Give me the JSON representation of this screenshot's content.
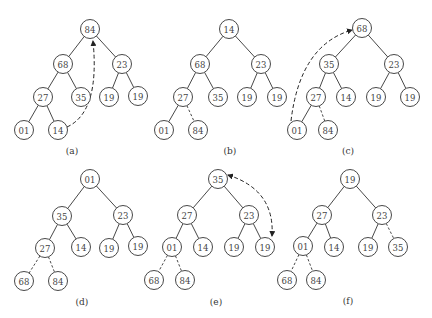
{
  "figure": {
    "node_radius": 9.5,
    "colors": {
      "stroke": "#333333",
      "text": "#444444",
      "background": "#ffffff"
    },
    "trees": [
      {
        "id": "a",
        "caption": "(a)",
        "caption_pos": [
          72,
          151
        ],
        "nodes": [
          {
            "value": "84",
            "x": 90,
            "y": 29
          },
          {
            "value": "68",
            "x": 63,
            "y": 64
          },
          {
            "value": "23",
            "x": 122,
            "y": 64
          },
          {
            "value": "27",
            "x": 43,
            "y": 97
          },
          {
            "value": "35",
            "x": 81,
            "y": 97
          },
          {
            "value": "19",
            "x": 109,
            "y": 97
          },
          {
            "value": "19",
            "x": 138,
            "y": 96
          },
          {
            "value": "01",
            "x": 24,
            "y": 130
          },
          {
            "value": "14",
            "x": 58,
            "y": 130
          }
        ],
        "edges": [
          [
            0,
            1,
            "solid"
          ],
          [
            0,
            2,
            "solid"
          ],
          [
            1,
            3,
            "solid"
          ],
          [
            1,
            4,
            "solid"
          ],
          [
            2,
            5,
            "solid"
          ],
          [
            2,
            6,
            "solid"
          ],
          [
            3,
            7,
            "solid"
          ],
          [
            3,
            8,
            "solid"
          ]
        ],
        "swap_arrow": {
          "from": 8,
          "to": 0,
          "path": "M67,127 Q100,112 93,41",
          "head": "end"
        }
      },
      {
        "id": "b",
        "caption": "(b)",
        "caption_pos": [
          230,
          151
        ],
        "nodes": [
          {
            "value": "14",
            "x": 229,
            "y": 29
          },
          {
            "value": "68",
            "x": 200,
            "y": 64
          },
          {
            "value": "23",
            "x": 261,
            "y": 64
          },
          {
            "value": "27",
            "x": 183,
            "y": 97
          },
          {
            "value": "35",
            "x": 218,
            "y": 97
          },
          {
            "value": "19",
            "x": 247,
            "y": 97
          },
          {
            "value": "19",
            "x": 277,
            "y": 97
          },
          {
            "value": "01",
            "x": 164,
            "y": 130
          },
          {
            "value": "84",
            "x": 198,
            "y": 130
          }
        ],
        "edges": [
          [
            0,
            1,
            "solid"
          ],
          [
            0,
            2,
            "solid"
          ],
          [
            1,
            3,
            "solid"
          ],
          [
            1,
            4,
            "solid"
          ],
          [
            2,
            5,
            "solid"
          ],
          [
            2,
            6,
            "solid"
          ],
          [
            3,
            7,
            "solid"
          ],
          [
            3,
            8,
            "dashed"
          ]
        ]
      },
      {
        "id": "c",
        "caption": "(c)",
        "caption_pos": [
          348,
          151
        ],
        "nodes": [
          {
            "value": "68",
            "x": 362,
            "y": 28
          },
          {
            "value": "35",
            "x": 329,
            "y": 64
          },
          {
            "value": "23",
            "x": 394,
            "y": 64
          },
          {
            "value": "27",
            "x": 316,
            "y": 97
          },
          {
            "value": "14",
            "x": 346,
            "y": 97
          },
          {
            "value": "19",
            "x": 376,
            "y": 97
          },
          {
            "value": "19",
            "x": 410,
            "y": 97
          },
          {
            "value": "01",
            "x": 297,
            "y": 130
          },
          {
            "value": "84",
            "x": 328,
            "y": 130
          }
        ],
        "edges": [
          [
            0,
            1,
            "solid"
          ],
          [
            0,
            2,
            "solid"
          ],
          [
            1,
            3,
            "solid"
          ],
          [
            1,
            4,
            "solid"
          ],
          [
            2,
            5,
            "solid"
          ],
          [
            2,
            6,
            "solid"
          ],
          [
            3,
            7,
            "solid"
          ],
          [
            3,
            8,
            "dashed"
          ]
        ],
        "swap_arrow": {
          "from": 7,
          "to": 0,
          "path": "M291,121 Q300,45 352,30",
          "head": "end"
        }
      },
      {
        "id": "d",
        "caption": "(d)",
        "caption_pos": [
          82,
          302
        ],
        "nodes": [
          {
            "value": "01",
            "x": 90,
            "y": 179
          },
          {
            "value": "35",
            "x": 62,
            "y": 216
          },
          {
            "value": "23",
            "x": 123,
            "y": 215
          },
          {
            "value": "27",
            "x": 45,
            "y": 248
          },
          {
            "value": "14",
            "x": 81,
            "y": 247
          },
          {
            "value": "19",
            "x": 109,
            "y": 248
          },
          {
            "value": "19",
            "x": 138,
            "y": 246
          },
          {
            "value": "68",
            "x": 24,
            "y": 281
          },
          {
            "value": "84",
            "x": 58,
            "y": 281
          }
        ],
        "edges": [
          [
            0,
            1,
            "solid"
          ],
          [
            0,
            2,
            "solid"
          ],
          [
            1,
            3,
            "solid"
          ],
          [
            1,
            4,
            "solid"
          ],
          [
            2,
            5,
            "solid"
          ],
          [
            2,
            6,
            "solid"
          ],
          [
            3,
            7,
            "dashed"
          ],
          [
            3,
            8,
            "dashed"
          ]
        ]
      },
      {
        "id": "e",
        "caption": "(e)",
        "caption_pos": [
          216,
          302
        ],
        "nodes": [
          {
            "value": "35",
            "x": 218,
            "y": 179
          },
          {
            "value": "27",
            "x": 187,
            "y": 215
          },
          {
            "value": "23",
            "x": 249,
            "y": 215
          },
          {
            "value": "01",
            "x": 172,
            "y": 247
          },
          {
            "value": "14",
            "x": 203,
            "y": 247
          },
          {
            "value": "19",
            "x": 234,
            "y": 247
          },
          {
            "value": "19",
            "x": 265,
            "y": 247
          },
          {
            "value": "68",
            "x": 154,
            "y": 280
          },
          {
            "value": "84",
            "x": 185,
            "y": 280
          }
        ],
        "edges": [
          [
            0,
            1,
            "solid"
          ],
          [
            0,
            2,
            "solid"
          ],
          [
            1,
            3,
            "solid"
          ],
          [
            1,
            4,
            "solid"
          ],
          [
            2,
            5,
            "solid"
          ],
          [
            2,
            6,
            "solid"
          ],
          [
            3,
            7,
            "dashed"
          ],
          [
            3,
            8,
            "dashed"
          ]
        ],
        "swap_arrow": {
          "from": 0,
          "to": 6,
          "path": "M228,175 Q275,190 272,236",
          "head": "both"
        }
      },
      {
        "id": "f",
        "caption": "(f)",
        "caption_pos": [
          348,
          301
        ],
        "nodes": [
          {
            "value": "19",
            "x": 350,
            "y": 179
          },
          {
            "value": "27",
            "x": 322,
            "y": 215
          },
          {
            "value": "23",
            "x": 382,
            "y": 215
          },
          {
            "value": "01",
            "x": 303,
            "y": 246
          },
          {
            "value": "14",
            "x": 334,
            "y": 247
          },
          {
            "value": "19",
            "x": 368,
            "y": 247
          },
          {
            "value": "35",
            "x": 398,
            "y": 247
          },
          {
            "value": "68",
            "x": 287,
            "y": 280
          },
          {
            "value": "84",
            "x": 316,
            "y": 280
          }
        ],
        "edges": [
          [
            0,
            1,
            "solid"
          ],
          [
            0,
            2,
            "solid"
          ],
          [
            1,
            3,
            "solid"
          ],
          [
            1,
            4,
            "solid"
          ],
          [
            2,
            5,
            "solid"
          ],
          [
            2,
            6,
            "dashed"
          ],
          [
            3,
            7,
            "dashed"
          ],
          [
            3,
            8,
            "dashed"
          ]
        ]
      }
    ]
  }
}
